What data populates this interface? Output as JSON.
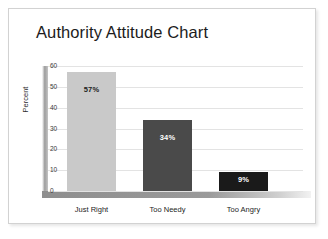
{
  "chart_data": {
    "type": "bar",
    "title": "Authority Attitude Chart",
    "xlabel": "",
    "ylabel": "Percent",
    "categories": [
      "Just Right",
      "Too Needy",
      "Too Angry"
    ],
    "values": [
      57,
      34,
      9
    ],
    "data_labels": [
      "57%",
      "34%",
      "9%"
    ],
    "ylim": [
      0,
      60
    ],
    "yticks": [
      0,
      10,
      20,
      30,
      40,
      50,
      60
    ],
    "ytick_labels": [
      "0",
      "10",
      "20",
      "30",
      "40",
      "50",
      "60"
    ],
    "grid": true,
    "legend": false,
    "series": [
      {
        "name": "Percent",
        "values": [
          57,
          34,
          9
        ]
      }
    ],
    "bar_colors": [
      "#c9c9c9",
      "#4a4a4a",
      "#1a1a1a"
    ],
    "label_colors": [
      "#1c1c1c",
      "#ffffff",
      "#ffffff"
    ]
  },
  "colors": {
    "card_border": "#d2d2d2",
    "background": "#ffffff",
    "gridline": "#e3e3e3",
    "title_text": "#1c1c1c",
    "axis_text": "#3a3a3a"
  }
}
